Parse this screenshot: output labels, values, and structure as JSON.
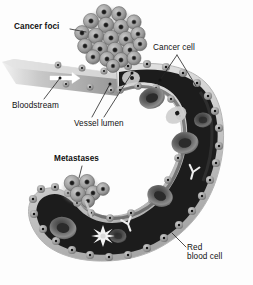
{
  "figure": {
    "background_color": "#fdfdfd",
    "text_color": "#111111",
    "style": "grayscale medical illustration"
  },
  "labels": [
    {
      "id": "cancer-foci",
      "text": "Cancer foci",
      "bold": true,
      "lines": 1
    },
    {
      "id": "cancer-cell",
      "text": "Cancer cell",
      "bold": false,
      "lines": 1
    },
    {
      "id": "bloodstream",
      "text": "Bloodstream",
      "bold": false,
      "lines": 1
    },
    {
      "id": "vessel-lumen",
      "text": "Vessel lumen",
      "bold": false,
      "lines": 1
    },
    {
      "id": "metastases",
      "text": "Metastases",
      "bold": true,
      "lines": 1
    },
    {
      "id": "red-blood-cell",
      "text": "Red\nblood cell",
      "bold": false,
      "lines": 2
    }
  ],
  "label_text": {
    "cancer_foci": "Cancer foci",
    "cancer_cell": "Cancer cell",
    "bloodstream": "Bloodstream",
    "vessel_lumen": "Vessel lumen",
    "metastases": "Metastases",
    "red_blood_cell": "Red\nblood cell"
  },
  "colors": {
    "vessel_lumen_dark": "#1d1d1d",
    "vessel_wall_light": "#d8d8d8",
    "endothelial_cell": "#8a8a8a",
    "endothelial_nucleus": "#1a1a1a",
    "tumor_cell_body": "#9e9e9e",
    "tumor_cell_nucleus": "#1c1c1c",
    "red_blood_cell": "#6d6d6d",
    "leukocyte": "#f2f2f2",
    "antibody": "#e9e9e9",
    "arrow": "#ffffff",
    "leader_line": "#2a2a2a"
  },
  "structures": {
    "vessel": {
      "name": "blood vessel",
      "shape": "C-curve opening to the left",
      "wall": "light rim studded with grey endothelial cells",
      "lumen": "dark interior"
    },
    "cancer_foci_cluster": {
      "name": "primary tumour cell cluster",
      "cell_count": 21,
      "position": "top, above vessel"
    },
    "metastases_cluster": {
      "name": "metastatic tumour cell cluster",
      "cell_count": 6,
      "position": "lower left, on vessel wall"
    },
    "red_blood_cells": {
      "name": "red blood cells",
      "count": 6,
      "shape": "biconcave donut"
    },
    "leukocyte": {
      "name": "white blood cell",
      "count": 1,
      "shape": "spiky star"
    },
    "antibodies": {
      "name": "antibodies",
      "count": 2,
      "shape": "Y"
    },
    "arrow": {
      "name": "blood flow arrow",
      "direction": "right"
    }
  }
}
